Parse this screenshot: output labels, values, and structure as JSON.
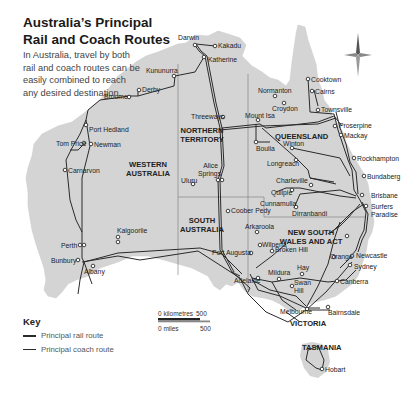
{
  "header": {
    "title": "Australia’s Principal Rail and Coach Routes",
    "intro": "In Australia, travel by both rail and coach routes can be easily combined to reach any desired destination."
  },
  "regions": {
    "wa": "WESTERN AUSTRALIA",
    "nt": "NORTHERN TERRITORY",
    "qld": "QUEENSLAND",
    "sa": "SOUTH AUSTRALIA",
    "nsw": "NEW SOUTH WALES AND ACT",
    "vic": "VICTORIA",
    "tas": "TASMANIA"
  },
  "cities": {
    "darwin": "Darwin",
    "kakadu": "Kakadu",
    "katherine": "Katherine",
    "kununurra": "Kununurra",
    "derby": "Derby",
    "broome": "Broome",
    "port_hedland": "Port Hedland",
    "tom_price": "Tom Price",
    "newman": "Newman",
    "carnarvon": "Carnarvon",
    "kalgoorlie": "Kalgoorlie",
    "perth": "Perth",
    "bunbury": "Bunbury",
    "albany": "Albany",
    "threeways": "Threeways",
    "alice_springs": "Alice Springs",
    "uluru": "Uluru",
    "coober_pedy": "Coober Pedy",
    "arkaroola": "Arkaroola",
    "wilpena": "Wilpena",
    "port_augusta": "Port Augusta",
    "adelaide": "Adelaide",
    "broken_hill": "Broken Hill",
    "mildura": "Mildura",
    "hay": "Hay",
    "swan_hill": "Swan Hill",
    "melbourne": "Melbourne",
    "bairnsdale": "Bairnsdale",
    "canberra": "Canberra",
    "sydney": "Sydney",
    "newcastle": "Newcastle",
    "orange": "Orange",
    "dirranbandi": "Dirranbandi",
    "cunnamulla": "Cunnamulla",
    "quilpie": "Quilpie",
    "charleville": "Charleville",
    "longreach": "Longreach",
    "winton": "Winton",
    "boulia": "Boulia",
    "mount_isa": "Mount Isa",
    "normanton": "Normanton",
    "croydon": "Croydon",
    "cooktown": "Cooktown",
    "cairns": "Cairns",
    "townsville": "Townsville",
    "proserpine": "Proserpine",
    "mackay": "Mackay",
    "rockhampton": "Rockhampton",
    "bundaberg": "Bundaberg",
    "brisbane": "Brisbane",
    "surfers_paradise": "Surfers Paradise",
    "hobart": "Hobart"
  },
  "key": {
    "title": "Key",
    "rail": "Principal rail route",
    "coach": "Principal coach route"
  },
  "scale": {
    "km_label": "0 kilometres",
    "km_value": "500",
    "mi_label": "0 miles",
    "mi_value": "500"
  },
  "colors": {
    "land": "#d4d4d4",
    "route": "#2a2a2a",
    "border": "#777777"
  }
}
